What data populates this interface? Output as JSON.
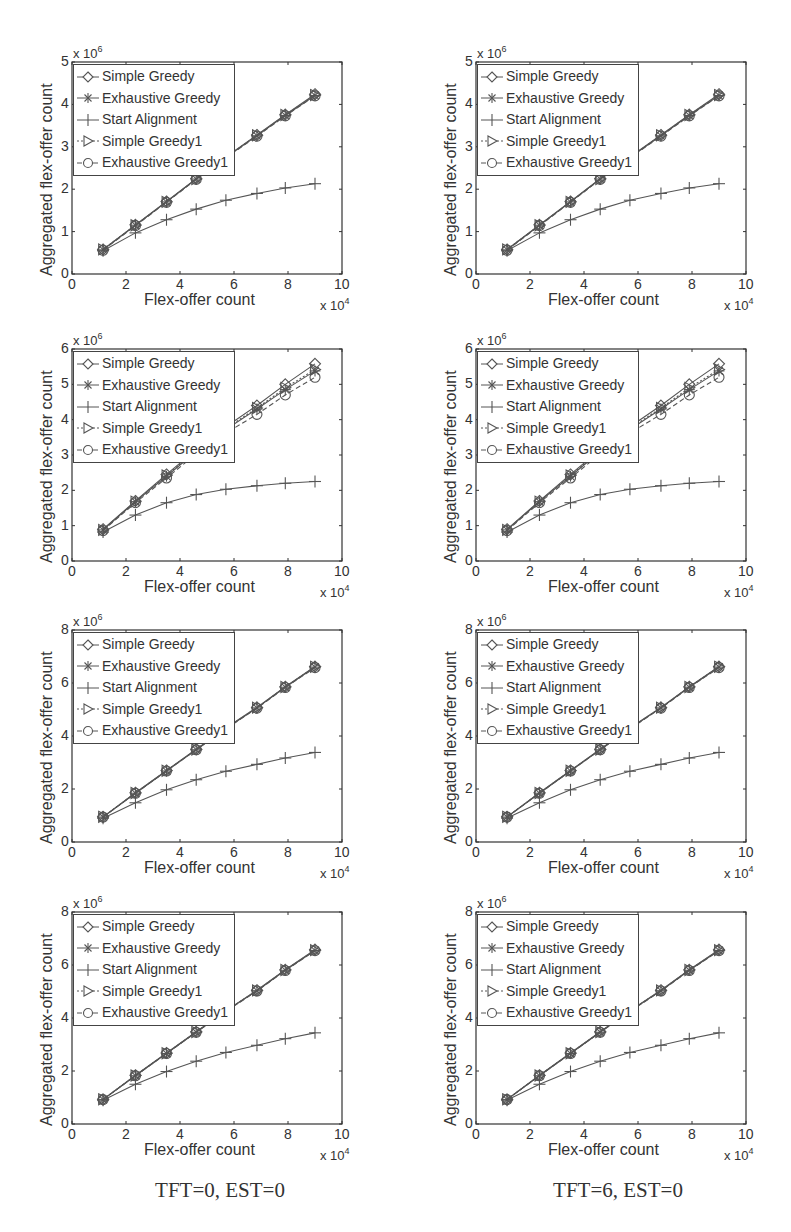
{
  "chart_data": [
    {
      "id": "left-row1",
      "type": "line",
      "column": "TFT=0, EST=0",
      "row": 1,
      "xlabel": "Flex-offer count",
      "x_multiplier": "x 10^4",
      "ylabel": "Aggregated flex-offer count",
      "y_multiplier": "x 10^6",
      "xlim": [
        0,
        10
      ],
      "ylim": [
        0,
        5
      ],
      "xticks": [
        0,
        2,
        4,
        6,
        8,
        10
      ],
      "yticks": [
        0,
        1,
        2,
        3,
        4,
        5
      ],
      "grid": false,
      "legend_position": "upper left",
      "x": [
        1.15,
        2.35,
        3.5,
        4.6,
        5.7,
        6.85,
        7.9,
        9.0
      ],
      "series": [
        {
          "name": "Simple Greedy",
          "marker": "diamond",
          "values": [
            0.58,
            1.16,
            1.71,
            2.25,
            2.76,
            3.28,
            3.76,
            4.24
          ]
        },
        {
          "name": "Exhaustive Greedy",
          "marker": "asterisk",
          "values": [
            0.57,
            1.15,
            1.7,
            2.24,
            2.75,
            3.26,
            3.74,
            4.21
          ]
        },
        {
          "name": "Start Alignment",
          "marker": "plus",
          "values": [
            0.55,
            0.97,
            1.28,
            1.53,
            1.74,
            1.9,
            2.03,
            2.13
          ]
        },
        {
          "name": "Simple Greedy1",
          "marker": "triangle-right",
          "values": [
            0.58,
            1.15,
            1.7,
            2.24,
            2.75,
            3.27,
            3.75,
            4.22
          ]
        },
        {
          "name": "Exhaustive Greedy1",
          "marker": "circle",
          "values": [
            0.56,
            1.14,
            1.69,
            2.23,
            2.74,
            3.25,
            3.73,
            4.2
          ]
        }
      ]
    },
    {
      "id": "right-row1",
      "type": "line",
      "column": "TFT=6, EST=0",
      "row": 1,
      "xlabel": "Flex-offer count",
      "x_multiplier": "x 10^4",
      "ylabel": "Aggregated flex-offer count",
      "y_multiplier": "x 10^6",
      "xlim": [
        0,
        10
      ],
      "ylim": [
        0,
        5
      ],
      "xticks": [
        0,
        2,
        4,
        6,
        8,
        10
      ],
      "yticks": [
        0,
        1,
        2,
        3,
        4,
        5
      ],
      "grid": false,
      "legend_position": "upper left",
      "x": [
        1.15,
        2.35,
        3.5,
        4.6,
        5.7,
        6.85,
        7.9,
        9.0
      ],
      "series": [
        {
          "name": "Simple Greedy",
          "marker": "diamond",
          "values": [
            0.58,
            1.16,
            1.71,
            2.25,
            2.76,
            3.28,
            3.76,
            4.24
          ]
        },
        {
          "name": "Exhaustive Greedy",
          "marker": "asterisk",
          "values": [
            0.57,
            1.15,
            1.7,
            2.24,
            2.75,
            3.26,
            3.74,
            4.21
          ]
        },
        {
          "name": "Start Alignment",
          "marker": "plus",
          "values": [
            0.55,
            0.97,
            1.28,
            1.53,
            1.74,
            1.9,
            2.03,
            2.13
          ]
        },
        {
          "name": "Simple Greedy1",
          "marker": "triangle-right",
          "values": [
            0.58,
            1.15,
            1.7,
            2.24,
            2.75,
            3.27,
            3.75,
            4.22
          ]
        },
        {
          "name": "Exhaustive Greedy1",
          "marker": "circle",
          "values": [
            0.56,
            1.14,
            1.69,
            2.23,
            2.74,
            3.25,
            3.73,
            4.2
          ]
        }
      ]
    },
    {
      "id": "left-row2",
      "type": "line",
      "column": "TFT=0, EST=0",
      "row": 2,
      "xlabel": "Flex-offer count",
      "x_multiplier": "x 10^4",
      "ylabel": "Aggregated flex-offer count",
      "y_multiplier": "x 10^6",
      "xlim": [
        0,
        10
      ],
      "ylim": [
        0,
        6
      ],
      "xticks": [
        0,
        2,
        4,
        6,
        8,
        10
      ],
      "yticks": [
        0,
        1,
        2,
        3,
        4,
        5,
        6
      ],
      "grid": false,
      "legend_position": "upper left",
      "x": [
        1.15,
        2.35,
        3.5,
        4.6,
        5.7,
        6.85,
        7.9,
        9.0
      ],
      "series": [
        {
          "name": "Simple Greedy",
          "marker": "diamond",
          "values": [
            0.9,
            1.7,
            2.45,
            3.15,
            3.8,
            4.4,
            5.0,
            5.58
          ]
        },
        {
          "name": "Exhaustive Greedy",
          "marker": "asterisk",
          "values": [
            0.88,
            1.68,
            2.4,
            3.1,
            3.72,
            4.3,
            4.85,
            5.38
          ]
        },
        {
          "name": "Start Alignment",
          "marker": "plus",
          "values": [
            0.82,
            1.3,
            1.65,
            1.88,
            2.03,
            2.13,
            2.2,
            2.25
          ]
        },
        {
          "name": "Simple Greedy1",
          "marker": "triangle-right",
          "values": [
            0.88,
            1.68,
            2.42,
            3.12,
            3.75,
            4.33,
            4.9,
            5.42
          ]
        },
        {
          "name": "Exhaustive Greedy1",
          "marker": "circle",
          "values": [
            0.86,
            1.65,
            2.35,
            3.03,
            3.62,
            4.15,
            4.7,
            5.2
          ]
        }
      ]
    },
    {
      "id": "right-row2",
      "type": "line",
      "column": "TFT=6, EST=0",
      "row": 2,
      "xlabel": "Flex-offer count",
      "x_multiplier": "x 10^4",
      "ylabel": "Aggregated flex-offer count",
      "y_multiplier": "x 10^6",
      "xlim": [
        0,
        10
      ],
      "ylim": [
        0,
        6
      ],
      "xticks": [
        0,
        2,
        4,
        6,
        8,
        10
      ],
      "yticks": [
        0,
        1,
        2,
        3,
        4,
        5,
        6
      ],
      "grid": false,
      "legend_position": "upper left",
      "x": [
        1.15,
        2.35,
        3.5,
        4.6,
        5.7,
        6.85,
        7.9,
        9.0
      ],
      "series": [
        {
          "name": "Simple Greedy",
          "marker": "diamond",
          "values": [
            0.9,
            1.7,
            2.45,
            3.15,
            3.8,
            4.4,
            5.0,
            5.58
          ]
        },
        {
          "name": "Exhaustive Greedy",
          "marker": "asterisk",
          "values": [
            0.88,
            1.68,
            2.4,
            3.1,
            3.72,
            4.3,
            4.85,
            5.38
          ]
        },
        {
          "name": "Start Alignment",
          "marker": "plus",
          "values": [
            0.82,
            1.3,
            1.65,
            1.88,
            2.03,
            2.13,
            2.2,
            2.25
          ]
        },
        {
          "name": "Simple Greedy1",
          "marker": "triangle-right",
          "values": [
            0.88,
            1.68,
            2.42,
            3.12,
            3.75,
            4.33,
            4.9,
            5.42
          ]
        },
        {
          "name": "Exhaustive Greedy1",
          "marker": "circle",
          "values": [
            0.86,
            1.65,
            2.35,
            3.03,
            3.62,
            4.15,
            4.7,
            5.2
          ]
        }
      ]
    },
    {
      "id": "left-row3",
      "type": "line",
      "column": "TFT=0, EST=0",
      "row": 3,
      "xlabel": "Flex-offer count",
      "x_multiplier": "x 10^4",
      "ylabel": "Aggregated flex-offer count",
      "y_multiplier": "x 10^6",
      "xlim": [
        0,
        10
      ],
      "ylim": [
        0,
        8
      ],
      "xticks": [
        0,
        2,
        4,
        6,
        8,
        10
      ],
      "yticks": [
        0,
        2,
        4,
        6,
        8
      ],
      "grid": false,
      "legend_position": "upper left",
      "x": [
        1.15,
        2.35,
        3.5,
        4.6,
        5.7,
        6.85,
        7.9,
        9.0
      ],
      "series": [
        {
          "name": "Simple Greedy",
          "marker": "diamond",
          "values": [
            0.95,
            1.86,
            2.7,
            3.5,
            4.3,
            5.08,
            5.86,
            6.62
          ]
        },
        {
          "name": "Exhaustive Greedy",
          "marker": "asterisk",
          "values": [
            0.94,
            1.84,
            2.68,
            3.48,
            4.28,
            5.06,
            5.84,
            6.6
          ]
        },
        {
          "name": "Start Alignment",
          "marker": "plus",
          "values": [
            0.9,
            1.48,
            1.97,
            2.35,
            2.67,
            2.93,
            3.17,
            3.38
          ]
        },
        {
          "name": "Simple Greedy1",
          "marker": "triangle-right",
          "values": [
            0.95,
            1.85,
            2.69,
            3.49,
            4.29,
            5.07,
            5.85,
            6.61
          ]
        },
        {
          "name": "Exhaustive Greedy1",
          "marker": "circle",
          "values": [
            0.94,
            1.84,
            2.68,
            3.48,
            4.27,
            5.05,
            5.83,
            6.58
          ]
        }
      ]
    },
    {
      "id": "right-row3",
      "type": "line",
      "column": "TFT=6, EST=0",
      "row": 3,
      "xlabel": "Flex-offer count",
      "x_multiplier": "x 10^4",
      "ylabel": "Aggregated flex-offer count",
      "y_multiplier": "x 10^6",
      "xlim": [
        0,
        10
      ],
      "ylim": [
        0,
        8
      ],
      "xticks": [
        0,
        2,
        4,
        6,
        8,
        10
      ],
      "yticks": [
        0,
        2,
        4,
        6,
        8
      ],
      "grid": false,
      "legend_position": "upper left",
      "x": [
        1.15,
        2.35,
        3.5,
        4.6,
        5.7,
        6.85,
        7.9,
        9.0
      ],
      "series": [
        {
          "name": "Simple Greedy",
          "marker": "diamond",
          "values": [
            0.95,
            1.86,
            2.7,
            3.5,
            4.3,
            5.08,
            5.86,
            6.62
          ]
        },
        {
          "name": "Exhaustive Greedy",
          "marker": "asterisk",
          "values": [
            0.94,
            1.84,
            2.68,
            3.48,
            4.28,
            5.06,
            5.84,
            6.6
          ]
        },
        {
          "name": "Start Alignment",
          "marker": "plus",
          "values": [
            0.9,
            1.48,
            1.97,
            2.35,
            2.67,
            2.93,
            3.17,
            3.38
          ]
        },
        {
          "name": "Simple Greedy1",
          "marker": "triangle-right",
          "values": [
            0.95,
            1.85,
            2.69,
            3.49,
            4.29,
            5.07,
            5.85,
            6.61
          ]
        },
        {
          "name": "Exhaustive Greedy1",
          "marker": "circle",
          "values": [
            0.94,
            1.84,
            2.68,
            3.48,
            4.27,
            5.05,
            5.83,
            6.58
          ]
        }
      ]
    },
    {
      "id": "left-row4",
      "type": "line",
      "column": "TFT=0, EST=0",
      "row": 4,
      "xlabel": "Flex-offer count",
      "x_multiplier": "x 10^4",
      "ylabel": "Aggregated flex-offer count",
      "y_multiplier": "x 10^6",
      "xlim": [
        0,
        10
      ],
      "ylim": [
        0,
        8
      ],
      "xticks": [
        0,
        2,
        4,
        6,
        8,
        10
      ],
      "yticks": [
        0,
        2,
        4,
        6,
        8
      ],
      "grid": false,
      "legend_position": "upper left",
      "x": [
        1.15,
        2.35,
        3.5,
        4.6,
        5.7,
        6.85,
        7.9,
        9.0
      ],
      "series": [
        {
          "name": "Simple Greedy",
          "marker": "diamond",
          "values": [
            0.93,
            1.84,
            2.68,
            3.48,
            4.28,
            5.05,
            5.82,
            6.58
          ]
        },
        {
          "name": "Exhaustive Greedy",
          "marker": "asterisk",
          "values": [
            0.92,
            1.82,
            2.66,
            3.46,
            4.26,
            5.03,
            5.8,
            6.55
          ]
        },
        {
          "name": "Start Alignment",
          "marker": "plus",
          "values": [
            0.9,
            1.5,
            1.98,
            2.37,
            2.7,
            2.97,
            3.22,
            3.44
          ]
        },
        {
          "name": "Simple Greedy1",
          "marker": "triangle-right",
          "values": [
            0.93,
            1.83,
            2.67,
            3.47,
            4.27,
            5.04,
            5.81,
            6.56
          ]
        },
        {
          "name": "Exhaustive Greedy1",
          "marker": "circle",
          "values": [
            0.92,
            1.82,
            2.66,
            3.46,
            4.25,
            5.02,
            5.79,
            6.54
          ]
        }
      ]
    },
    {
      "id": "right-row4",
      "type": "line",
      "column": "TFT=6, EST=0",
      "row": 4,
      "xlabel": "Flex-offer count",
      "x_multiplier": "x 10^4",
      "ylabel": "Aggregated flex-offer count",
      "y_multiplier": "x 10^6",
      "xlim": [
        0,
        10
      ],
      "ylim": [
        0,
        8
      ],
      "xticks": [
        0,
        2,
        4,
        6,
        8,
        10
      ],
      "yticks": [
        0,
        2,
        4,
        6,
        8
      ],
      "grid": false,
      "legend_position": "upper left",
      "x": [
        1.15,
        2.35,
        3.5,
        4.6,
        5.7,
        6.85,
        7.9,
        9.0
      ],
      "series": [
        {
          "name": "Simple Greedy",
          "marker": "diamond",
          "values": [
            0.93,
            1.84,
            2.68,
            3.48,
            4.28,
            5.05,
            5.82,
            6.58
          ]
        },
        {
          "name": "Exhaustive Greedy",
          "marker": "asterisk",
          "values": [
            0.92,
            1.82,
            2.66,
            3.46,
            4.26,
            5.03,
            5.8,
            6.55
          ]
        },
        {
          "name": "Start Alignment",
          "marker": "plus",
          "values": [
            0.9,
            1.5,
            1.98,
            2.37,
            2.7,
            2.97,
            3.22,
            3.44
          ]
        },
        {
          "name": "Simple Greedy1",
          "marker": "triangle-right",
          "values": [
            0.93,
            1.83,
            2.67,
            3.47,
            4.27,
            5.04,
            5.81,
            6.56
          ]
        },
        {
          "name": "Exhaustive Greedy1",
          "marker": "circle",
          "values": [
            0.92,
            1.82,
            2.66,
            3.46,
            4.25,
            5.02,
            5.79,
            6.54
          ]
        }
      ]
    }
  ],
  "captions": {
    "left": "TFT=0, EST=0",
    "right": "TFT=6, EST=0"
  },
  "style": {
    "line_color": "#555555",
    "axis_color": "#333333",
    "text_color": "#333333"
  }
}
